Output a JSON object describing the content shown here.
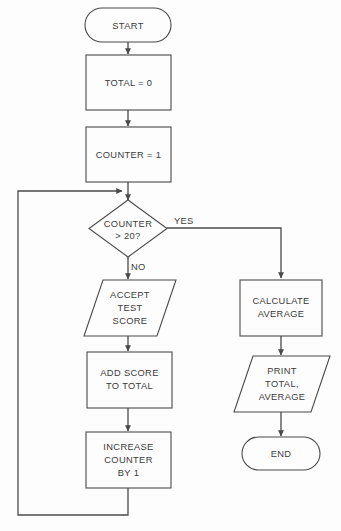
{
  "diagram": {
    "background_color": "#fdfdfd",
    "stroke_color": "#4a4a4a",
    "text_color": "#3a3a3a",
    "nodes": {
      "start": {
        "label": "START",
        "shape": "terminator"
      },
      "total_init": {
        "label": "TOTAL = 0",
        "shape": "process"
      },
      "counter_init": {
        "label": "COUNTER = 1",
        "shape": "process"
      },
      "decision": {
        "line1": "COUNTER",
        "line2": "> 20?",
        "shape": "decision"
      },
      "accept_score": {
        "line1": "ACCEPT",
        "line2": "TEST",
        "line3": "SCORE",
        "shape": "input-output"
      },
      "add_score": {
        "line1": "ADD SCORE",
        "line2": "TO TOTAL",
        "shape": "process"
      },
      "increase_counter": {
        "line1": "INCREASE",
        "line2": "COUNTER",
        "line3": "BY 1",
        "shape": "process"
      },
      "calculate_average": {
        "line1": "CALCULATE",
        "line2": "AVERAGE",
        "shape": "process"
      },
      "print_results": {
        "line1": "PRINT",
        "line2": "TOTAL,",
        "line3": "AVERAGE",
        "shape": "input-output"
      },
      "end": {
        "label": "END",
        "shape": "terminator"
      }
    },
    "edge_labels": {
      "yes": "YES",
      "no": "NO"
    }
  }
}
